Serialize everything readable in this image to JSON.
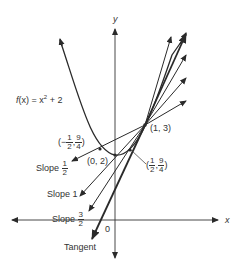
{
  "diagram": {
    "function_label": {
      "prefix": "f",
      "arg": "(x)",
      "eq": " = x",
      "exp": "2",
      "suffix": " + 2"
    },
    "axes": {
      "x_label": "x",
      "y_label": "y",
      "origin_label": "0"
    },
    "points": {
      "p13": "(1, 3)",
      "p02": "(0, 2)",
      "neg_half": {
        "open": "(−",
        "x_num": "1",
        "x_den": "2",
        "y_num": "9",
        "y_den": "4",
        "close": ")"
      },
      "pos_half": {
        "open": "(",
        "x_num": "1",
        "x_den": "2",
        "y_num": "9",
        "y_den": "4",
        "close": ")"
      }
    },
    "slope_labels": {
      "half": {
        "word": "Slope",
        "num": "1",
        "den": "2"
      },
      "one": {
        "word": "Slope",
        "value": "1"
      },
      "three_halves": {
        "word": "Slope",
        "num": "3",
        "den": "2"
      },
      "tangent": "Tangent"
    },
    "colors": {
      "ink": "#2a2a2a",
      "background": "#ffffff"
    }
  }
}
